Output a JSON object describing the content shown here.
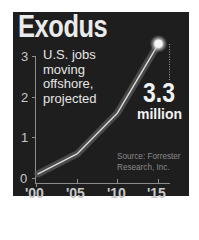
{
  "chart_data": {
    "type": "line",
    "title": "Exodus",
    "subtitle": "U.S. jobs moving offshore, projected",
    "subtitle_lines": [
      "U.S. jobs",
      "moving",
      "offshore,",
      "projected"
    ],
    "xlabel": "",
    "ylabel": "",
    "categories": [
      "'00",
      "'05",
      "'10",
      "'15"
    ],
    "x": [
      2000,
      2005,
      2010,
      2015
    ],
    "series": [
      {
        "name": "U.S. jobs moving offshore (millions)",
        "values": [
          0.1,
          0.6,
          1.6,
          3.3
        ]
      }
    ],
    "yticks": [
      "0",
      "1",
      "2",
      "3"
    ],
    "ylim": [
      0,
      3.3
    ],
    "grid": false,
    "legend": "none",
    "annotation": {
      "value": "3.3",
      "unit": "million",
      "target": "'15"
    },
    "source": "Source: Forrester Research, Inc."
  },
  "header": {
    "title": "Exodus"
  },
  "source_lines": [
    "Source: Forrester",
    "Research, Inc."
  ],
  "colors": {
    "panel": "#1e1e1e",
    "line": "#d9d9d9",
    "glow": "#6a6a6a",
    "text": "#ebebeb",
    "axis": "#8c8c8c"
  }
}
